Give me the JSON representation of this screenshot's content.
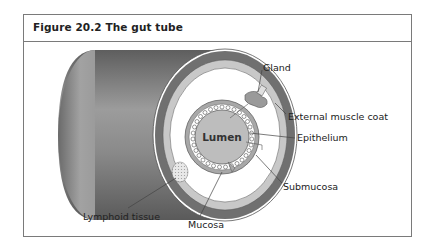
{
  "figure": {
    "title": "Figure 20.2 The gut tube"
  },
  "diagram": {
    "center_label": "Lumen",
    "labels": {
      "gland": "Gland",
      "external_muscle_coat": "External muscle coat",
      "epithelium": "Epithelium",
      "submucosa": "Submucosa",
      "lymphoid_tissue": "Lymphoid tissue",
      "mucosa": "Mucosa"
    },
    "colors": {
      "tube_body_dark": "#6e6e6e",
      "tube_body_light": "#9a9a9a",
      "muscle_coat": "#707070",
      "band_light": "#c8c8c8",
      "submucosa": "#ffffff",
      "mucosa": "#a8a8a8",
      "lumen": "#bdbdbd",
      "frame": "#7a7a7a"
    }
  }
}
